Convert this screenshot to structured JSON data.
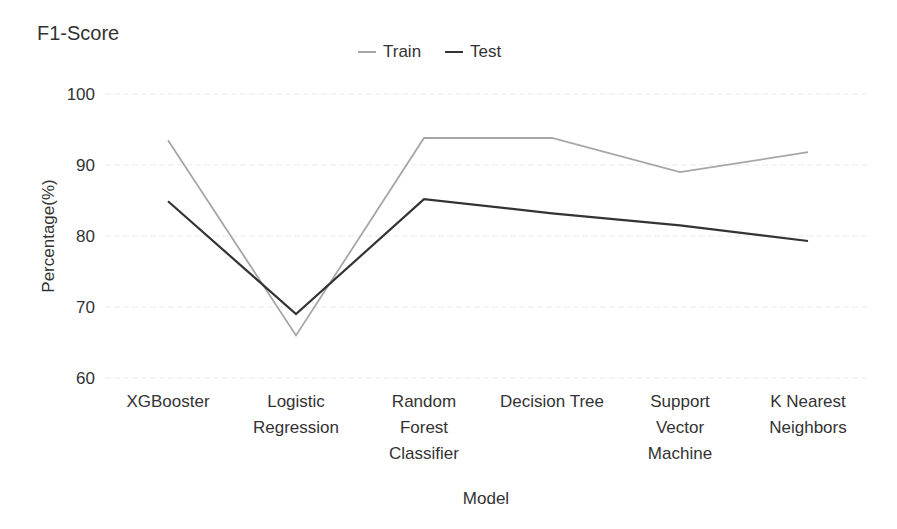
{
  "chart_data": {
    "type": "line",
    "title": "F1-Score",
    "xlabel": "Model",
    "ylabel": "Percentage(%)",
    "ylim": [
      60,
      100
    ],
    "yticks": [
      60,
      70,
      80,
      90,
      100
    ],
    "grid": true,
    "legend_position": "top",
    "categories": [
      "XGBooster",
      "Logistic Regression",
      "Random Forest Classifier",
      "Decision Tree",
      "Support Vector Machine",
      "K Nearest Neighbors"
    ],
    "category_lines": [
      [
        "XGBooster"
      ],
      [
        "Logistic",
        "Regression"
      ],
      [
        "Random",
        "Forest",
        "Classifier"
      ],
      [
        "Decision Tree"
      ],
      [
        "Support",
        "Vector",
        "Machine"
      ],
      [
        "K Nearest",
        "Neighbors"
      ]
    ],
    "series": [
      {
        "name": "Train",
        "color": "#a6a6a6",
        "values": [
          93.5,
          66.0,
          93.8,
          93.8,
          89.0,
          91.8
        ]
      },
      {
        "name": "Test",
        "color": "#333333",
        "values": [
          84.9,
          69.0,
          85.2,
          83.2,
          81.5,
          79.3
        ]
      }
    ]
  }
}
